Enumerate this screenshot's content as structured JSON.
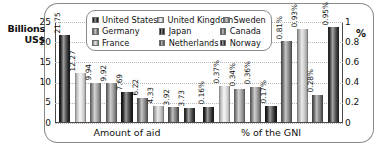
{
  "axis": {
    "left_title": "Billions US$",
    "left_title_line1": "Billions",
    "left_title_line2": "US$",
    "right_title": "%",
    "left_ticks": [
      "25",
      "20",
      "15",
      "10",
      "5",
      "0"
    ],
    "right_ticks": [
      "1",
      "0.8",
      "0.6",
      "0.4",
      "0.2",
      "0"
    ]
  },
  "legend": {
    "items": [
      {
        "label": "United States",
        "color": "#2b2b2b"
      },
      {
        "label": "United Kingdom",
        "color": "#e2e2e2"
      },
      {
        "label": "Sweden",
        "color": "#9a9a9a"
      },
      {
        "label": "Germany",
        "color": "#8f8f8f"
      },
      {
        "label": "Japan",
        "color": "#242424"
      },
      {
        "label": "Canada",
        "color": "#7d7d7d"
      },
      {
        "label": "France",
        "color": "#c9c9c9"
      },
      {
        "label": "Netherlands",
        "color": "#6f6f6f"
      },
      {
        "label": "Norway",
        "color": "#3a3a3a"
      }
    ]
  },
  "groups": [
    {
      "caption": "Amount of aid"
    },
    {
      "caption": "% of the GNI"
    }
  ],
  "chart_data": {
    "type": "bar",
    "title": "",
    "xlabel": "",
    "ylabel": "Billions US$",
    "y2label": "%",
    "ylim": [
      0,
      25
    ],
    "y2lim": [
      0,
      1
    ],
    "grid": true,
    "legend_position": "top",
    "categories": [
      "United States",
      "United Kingdom",
      "Sweden",
      "Germany",
      "Japan",
      "Canada",
      "France",
      "Netherlands",
      "Norway"
    ],
    "groups": [
      {
        "name": "Amount of aid",
        "axis": "left",
        "unit": "Billions US$",
        "bars": [
          {
            "country": "United States",
            "value": 21.75,
            "label": "21.75",
            "color": "#2b2b2b"
          },
          {
            "country": "United Kingdom",
            "value": 12.27,
            "label": "12.27",
            "color": "#e2e2e2"
          },
          {
            "country": "Sweden",
            "value": 9.94,
            "label": "9.94",
            "color": "#9a9a9a"
          },
          {
            "country": "Germany",
            "value": 9.92,
            "label": "9.92",
            "color": "#8f8f8f"
          },
          {
            "country": "Japan",
            "value": 7.69,
            "label": "7.69",
            "color": "#242424"
          },
          {
            "country": "Canada",
            "value": 6.22,
            "label": "6.22",
            "color": "#7d7d7d"
          },
          {
            "country": "France",
            "value": 4.33,
            "label": "4.33",
            "color": "#c9c9c9"
          },
          {
            "country": "Netherlands",
            "value": 3.92,
            "label": "3.92",
            "color": "#6f6f6f"
          },
          {
            "country": "Norway",
            "value": 3.73,
            "label": "3.73",
            "color": "#3a3a3a"
          }
        ]
      },
      {
        "name": "% of the GNI",
        "axis": "right",
        "unit": "%",
        "bars": [
          {
            "country": "United States",
            "value": 0.16,
            "label": "0.16%",
            "color": "#2b2b2b"
          },
          {
            "country": "United Kingdom",
            "value": 0.37,
            "label": "0.37%",
            "color": "#e2e2e2"
          },
          {
            "country": "Sweden",
            "value": 0.34,
            "label": "0.34%",
            "color": "#9a9a9a"
          },
          {
            "country": "Germany",
            "value": 0.36,
            "label": "0.36%",
            "color": "#8f8f8f"
          },
          {
            "country": "Japan",
            "value": 0.17,
            "label": "0.17%",
            "color": "#242424"
          },
          {
            "country": "Canada",
            "value": 0.81,
            "label": "0.81%",
            "color": "#7d7d7d"
          },
          {
            "country": "France",
            "value": 0.93,
            "label": "0.93%",
            "color": "#c9c9c9"
          },
          {
            "country": "Netherlands",
            "value": 0.28,
            "label": "0.28%",
            "color": "#6f6f6f"
          },
          {
            "country": "Norway",
            "value": 0.95,
            "label": "0.95%",
            "color": "#3a3a3a"
          }
        ]
      }
    ]
  }
}
